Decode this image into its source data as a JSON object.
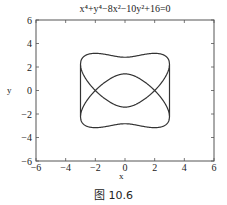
{
  "figure": {
    "title": "x⁴+y⁴−8x²−10y²+16=0",
    "caption": "图 10.6"
  },
  "chart_data": {
    "type": "line",
    "title": "x⁴+y⁴−8x²−10y²+16=0",
    "xlabel": "x",
    "ylabel": "y",
    "xlim": [
      -6,
      6
    ],
    "ylim": [
      -6,
      6
    ],
    "xticks": [
      -6,
      -4,
      -2,
      0,
      2,
      4,
      6
    ],
    "yticks": [
      -6,
      -4,
      -2,
      0,
      2,
      4,
      6
    ],
    "xtick_labels": [
      "−6",
      "−4",
      "−2",
      "0",
      "2",
      "4",
      "6"
    ],
    "ytick_labels": [
      "−6",
      "−4",
      "−2",
      "0",
      "2",
      "4",
      "6"
    ],
    "grid": false,
    "legend": null,
    "equation": "x^4+y^4-8x^2-10y^2+16=0",
    "series": [
      {
        "name": "implicit curve",
        "color": "#333333",
        "description": "Two intersecting oval loops, |x|<=3",
        "sample_points": [
          {
            "x": 0,
            "y": [
              2.828,
              1.414,
              -1.414,
              -2.828
            ]
          },
          {
            "x": 1,
            "y": [
              3.0,
              1.0,
              -1.0,
              -3.0
            ]
          },
          {
            "x": 2,
            "y": [
              3.162,
              0.0,
              -3.162
            ]
          },
          {
            "x": 2.5,
            "y": [
              3.077,
              0.731,
              -0.731,
              -3.077
            ]
          },
          {
            "x": 3,
            "y": [
              2.236,
              -2.236
            ]
          },
          {
            "x": -1,
            "y": [
              3.0,
              1.0,
              -1.0,
              -3.0
            ]
          },
          {
            "x": -2,
            "y": [
              3.162,
              0.0,
              -3.162
            ]
          },
          {
            "x": -2.5,
            "y": [
              3.077,
              0.731,
              -0.731,
              -3.077
            ]
          },
          {
            "x": -3,
            "y": [
              2.236,
              -2.236
            ]
          }
        ]
      }
    ]
  },
  "axes": {
    "xlabel": "x",
    "ylabel": "y"
  }
}
